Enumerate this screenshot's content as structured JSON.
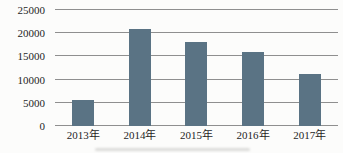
{
  "chart_data": {
    "type": "bar",
    "title": "",
    "categories": [
      "2013年",
      "2014年",
      "2015年",
      "2016年",
      "2017年"
    ],
    "values": [
      5500,
      21000,
      18000,
      16000,
      11200
    ],
    "xlabel": "",
    "ylabel": "",
    "ylim": [
      0,
      25000
    ],
    "yticks": [
      0,
      5000,
      10000,
      15000,
      20000,
      25000
    ],
    "grid": true,
    "legend": false,
    "colors": {
      "bar": "#5a7384",
      "gridline": "#8f8f8f",
      "axis_line": "#8f8f8f",
      "tick_text": "#1f1f1f",
      "background": "#fcfcfb"
    }
  }
}
